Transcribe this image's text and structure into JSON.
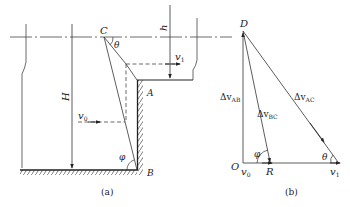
{
  "figure_a": {
    "caption": "(a)",
    "points": {
      "C": "C",
      "A": "A",
      "B": "B"
    },
    "dimensions": {
      "H": "H",
      "h": "h"
    },
    "angles": {
      "theta": "θ",
      "phi": "φ"
    },
    "velocities": {
      "v0_main": "v",
      "v0_sub": "0",
      "v1_main": "v",
      "v1_sub": "1"
    }
  },
  "figure_b": {
    "caption": "(b)",
    "points": {
      "D": "D",
      "O": "O",
      "R": "R"
    },
    "vectors": {
      "dv_prefix": "Δv",
      "ab_sub": "AB",
      "bc_sub": "BC",
      "ac_sub": "AC"
    },
    "angles": {
      "theta": "θ",
      "phi": "φ"
    },
    "velocities": {
      "v0_main": "v",
      "v0_sub": "0",
      "v1_main": "v",
      "v1_sub": "1"
    }
  },
  "colors": {
    "line": "#333333",
    "background": "#ffffff"
  }
}
